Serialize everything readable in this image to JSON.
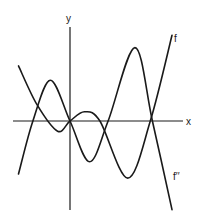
{
  "chart_data": {
    "type": "line",
    "title": "",
    "xlabel": "x",
    "ylabel": "y",
    "grid": false,
    "xlim": [
      -5.3,
      10.6
    ],
    "ylim": [
      -8.4,
      10.4
    ],
    "series": [
      {
        "name": "f",
        "label": "f",
        "points": [
          [
            -5.0,
            5.4
          ],
          [
            -3.2,
            1.6
          ],
          [
            -1.2,
            -1.0
          ],
          [
            0,
            0
          ],
          [
            1.4,
            0.9
          ],
          [
            2.9,
            0
          ],
          [
            5.6,
            -5.6
          ],
          [
            7.8,
            0
          ],
          [
            9.9,
            8.4
          ]
        ]
      },
      {
        "name": "f-double-prime",
        "label": "f′′",
        "points": [
          [
            -5.0,
            -5.2
          ],
          [
            -3.6,
            0
          ],
          [
            -1.9,
            4.0
          ],
          [
            0,
            0
          ],
          [
            1.9,
            -4.0
          ],
          [
            3.7,
            0
          ],
          [
            6.3,
            7.2
          ],
          [
            8.0,
            0
          ],
          [
            9.9,
            -8.7
          ]
        ]
      }
    ]
  },
  "labels": {
    "x_axis": "x",
    "y_axis": "y",
    "f": "f",
    "f_double_prime": "f′′"
  }
}
